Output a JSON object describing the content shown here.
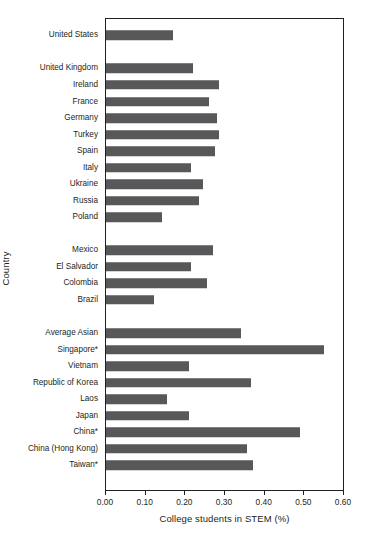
{
  "chart_data": {
    "type": "bar",
    "orientation": "horizontal",
    "title": "",
    "xlabel": "College students in STEM (%)",
    "ylabel": "Country",
    "xlim": [
      0.0,
      0.6
    ],
    "xticks": [
      0.0,
      0.1,
      0.2,
      0.3,
      0.4,
      0.5,
      0.6
    ],
    "xtick_labels": [
      "0.00",
      "0.10",
      "0.20",
      "0.30",
      "0.40",
      "0.50",
      "0.60"
    ],
    "grid": false,
    "legend": null,
    "bar_color": "#58585a",
    "frame_color": "#231f20",
    "categories": [
      "United States",
      "United Kingdom",
      "Ireland",
      "France",
      "Germany",
      "Turkey",
      "Spain",
      "Italy",
      "Ukraine",
      "Russia",
      "Poland",
      "Mexico",
      "El Salvador",
      "Colombia",
      "Brazil",
      "Average Asian",
      "Singapore*",
      "Vietnam",
      "Republic of Korea",
      "Laos",
      "Japan",
      "China*",
      "China (Hong Kong)",
      "Taiwan*"
    ],
    "values": [
      0.17,
      0.22,
      0.285,
      0.26,
      0.28,
      0.285,
      0.275,
      0.215,
      0.245,
      0.235,
      0.14,
      0.27,
      0.215,
      0.255,
      0.12,
      0.34,
      0.55,
      0.21,
      0.365,
      0.155,
      0.21,
      0.49,
      0.355,
      0.37
    ],
    "gaps_after": [
      0,
      1,
      2,
      3,
      4,
      5,
      6,
      7,
      9,
      10,
      14,
      15
    ]
  }
}
